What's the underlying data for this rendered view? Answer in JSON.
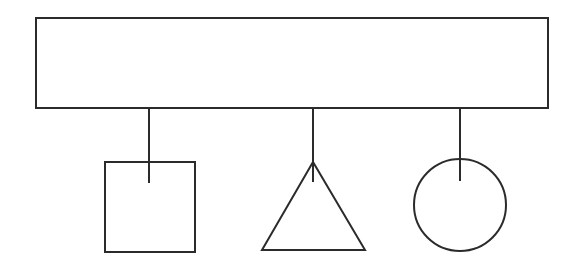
{
  "diagram": {
    "stroke_color": "#2b2b2b",
    "background": "#ffffff",
    "container": {
      "shape": "rectangle",
      "x": 36,
      "y": 18,
      "width": 512,
      "height": 90
    },
    "children": [
      {
        "shape": "square",
        "connector": {
          "x": 149,
          "y1": 108,
          "y2": 183
        },
        "x": 105,
        "y": 162,
        "width": 90,
        "height": 90
      },
      {
        "shape": "triangle",
        "connector": {
          "x": 313,
          "y1": 108,
          "y2": 182
        },
        "points": "313,162 262,250 365,250"
      },
      {
        "shape": "circle",
        "connector": {
          "x": 460,
          "y1": 108,
          "y2": 181
        },
        "cx": 460,
        "cy": 205,
        "r": 46
      }
    ]
  }
}
